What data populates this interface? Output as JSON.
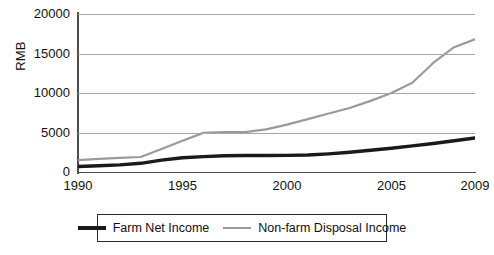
{
  "chart_data": {
    "type": "line",
    "title": "",
    "xlabel": "",
    "ylabel": "RMB",
    "xlim": [
      1990,
      2009
    ],
    "ylim": [
      0,
      20000
    ],
    "grid": true,
    "legend_position": "bottom",
    "y_ticks": [
      20000,
      15000,
      10000,
      5000,
      0
    ],
    "y_tick_labels": [
      "20000",
      "15000",
      "10000",
      "5000",
      "0"
    ],
    "x_ticks": [
      1990,
      1995,
      2000,
      2005,
      2009
    ],
    "x_tick_labels": [
      "1990",
      "1995",
      "2000",
      "2005",
      "2009"
    ],
    "x": [
      1990,
      1991,
      1992,
      1993,
      1994,
      1995,
      1996,
      1997,
      1998,
      1999,
      2000,
      2001,
      2002,
      2003,
      2004,
      2005,
      2006,
      2007,
      2008,
      2009
    ],
    "series": [
      {
        "name": "Farm Net Income",
        "color": "#1a1a1a",
        "line_width": 3.4,
        "values": [
          700,
          790,
          900,
          1100,
          1500,
          1800,
          1950,
          2050,
          2080,
          2080,
          2100,
          2150,
          2300,
          2500,
          2750,
          3000,
          3300,
          3600,
          3950,
          4300
        ]
      },
      {
        "name": "Non-farm Disposal Income",
        "color": "#9a9a9a",
        "line_width": 2.2,
        "values": [
          1500,
          1650,
          1800,
          1900,
          2900,
          3950,
          4950,
          5050,
          5050,
          5400,
          6000,
          6700,
          7400,
          8100,
          9000,
          10000,
          11300,
          13800,
          15800,
          16800
        ]
      }
    ]
  },
  "axis": {
    "y_title": "RMB"
  },
  "legend": {
    "items": [
      {
        "label": "Farm Net Income",
        "swatch": "dark-line-swatch"
      },
      {
        "label": "Non-farm Disposal Income",
        "swatch": "gray-line-swatch"
      }
    ]
  }
}
